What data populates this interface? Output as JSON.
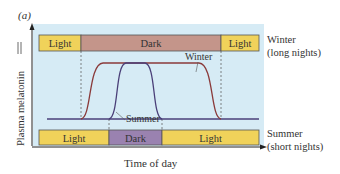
{
  "panel_label": "(a)",
  "y_axis_label": "Plasma melatonin",
  "x_axis_label": "Time of day",
  "winter": {
    "name": "Winter",
    "caption_line1": "Winter",
    "caption_line2": "(long nights)",
    "bar": [
      {
        "label": "Light",
        "start": 39,
        "end": 81,
        "color": "#f0d25a"
      },
      {
        "label": "Dark",
        "start": 81,
        "end": 221,
        "color": "#c4958a"
      },
      {
        "label": "Light",
        "start": 221,
        "end": 259,
        "color": "#f0d25a"
      }
    ],
    "curve_color": "#8a3a3a",
    "curve_label": "Winter"
  },
  "summer": {
    "name": "Summer",
    "caption_line1": "Summer",
    "caption_line2": "(short nights)",
    "bar": [
      {
        "label": "Light",
        "start": 39,
        "end": 109,
        "color": "#f0d25a"
      },
      {
        "label": "Dark",
        "start": 109,
        "end": 162,
        "color": "#9a82b0"
      },
      {
        "label": "Light",
        "start": 162,
        "end": 259,
        "color": "#f0d25a"
      }
    ],
    "curve_color": "#4a3f78",
    "curve_label": "Summer"
  },
  "colors": {
    "panel_bg": "#d6ebf5",
    "axis": "#222222",
    "dashed": "#555555",
    "text": "#333333"
  }
}
